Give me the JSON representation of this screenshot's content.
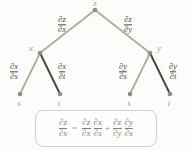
{
  "colors": {
    "background": "#fcfcfa",
    "edge_highlight": "#b2aba0",
    "edge_dark": "#4b4a46",
    "node_fill": "#8f8d88",
    "node_label": "#a29f99",
    "math_text": "#4e4b46",
    "formula_text": "#85827c",
    "formula_border": "#d2d0ca"
  },
  "tree": {
    "nodes": {
      "z": "z",
      "x": "x",
      "y": "y",
      "s1": "s",
      "t1": "t",
      "s2": "s",
      "t2": "t"
    },
    "edge_labels": {
      "dz_dx": {
        "num": "∂z",
        "den": "∂x"
      },
      "dz_dy": {
        "num": "∂z",
        "den": "∂y"
      },
      "dx_ds": {
        "num": "∂x",
        "den": "∂s"
      },
      "dx_dt": {
        "num": "∂x",
        "den": "∂t"
      },
      "dy_ds": {
        "num": "∂y",
        "den": "∂s"
      },
      "dy_dt": {
        "num": "∂y",
        "den": "∂t"
      }
    }
  },
  "formula": {
    "lhs": {
      "num": "∂z",
      "den": "∂s"
    },
    "equals": "=",
    "term1_factor1": {
      "num": "∂z",
      "den": "∂x"
    },
    "term1_factor2": {
      "num": "∂x",
      "den": "∂s"
    },
    "plus": "+",
    "term2_factor1": {
      "num": "∂z",
      "den": "∂y"
    },
    "term2_factor2": {
      "num": "∂y",
      "den": "∂s"
    }
  }
}
